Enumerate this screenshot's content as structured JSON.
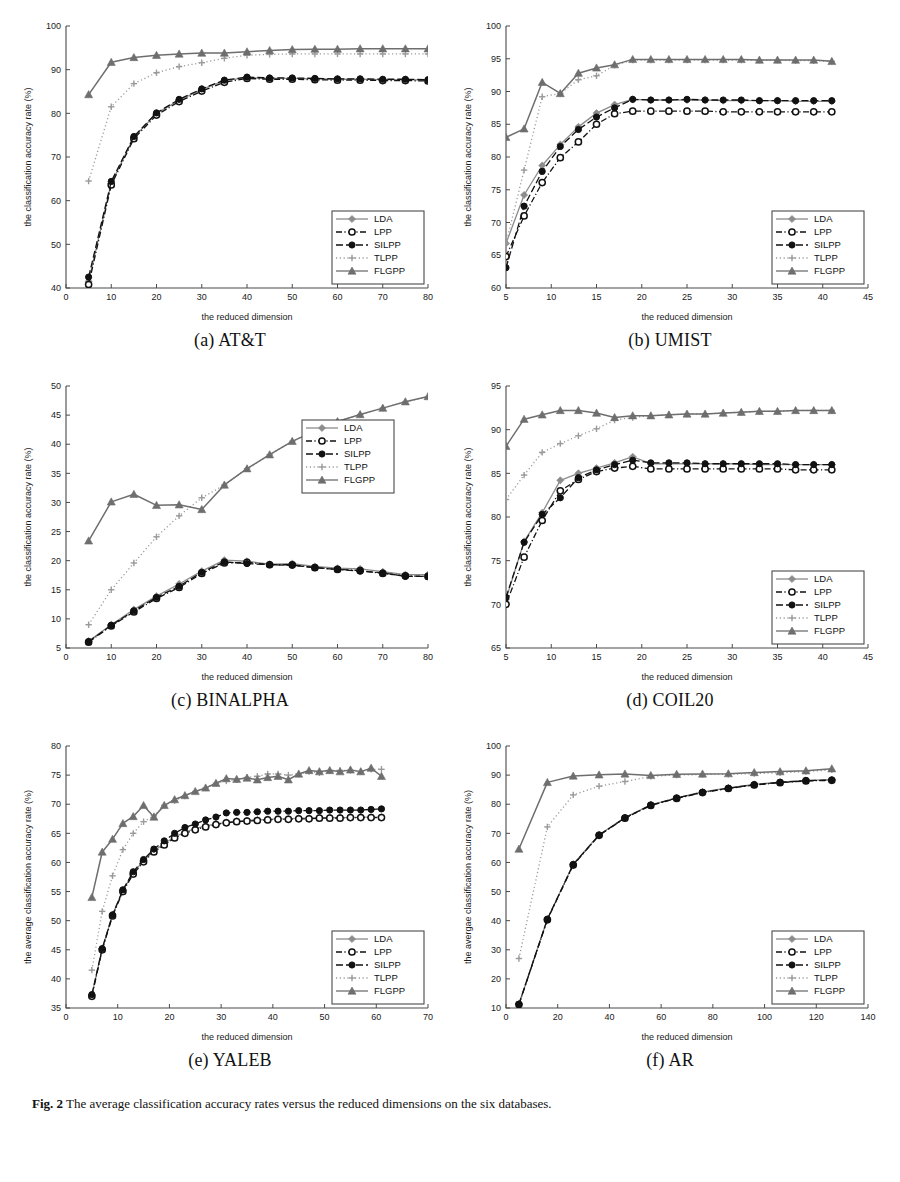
{
  "figure": {
    "caption_label": "Fig. 2",
    "caption_text": "The average classification accuracy rates versus the reduced dimensions on the six databases.",
    "series_names": [
      "LDA",
      "LPP",
      "SILPP",
      "TLPP",
      "FLGPP"
    ],
    "series_colors": {
      "LDA": "#8c8c8c",
      "LPP": "#111111",
      "SILPP": "#111111",
      "TLPP": "#9a9a9a",
      "FLGPP": "#6e6e6e"
    },
    "series_markers": {
      "LDA": "diamond",
      "LPP": "circle-open",
      "SILPP": "circle-filled",
      "TLPP": "plus",
      "FLGPP": "triangle"
    },
    "series_dash": {
      "LDA": "solid",
      "LPP": "dashdot",
      "SILPP": "dashed",
      "TLPP": "dotted",
      "FLGPP": "solid"
    }
  },
  "chart_data": [
    {
      "id": "att",
      "type": "line",
      "title": "(a) AT&T",
      "xlabel": "the reduced dimension",
      "ylabel": "the classification accuracy rate (%)",
      "xlim": [
        0,
        80
      ],
      "ylim": [
        40,
        100
      ],
      "xticks": [
        0,
        10,
        20,
        30,
        40,
        50,
        60,
        70,
        80
      ],
      "yticks": [
        40,
        50,
        60,
        70,
        80,
        90,
        100
      ],
      "grid": false,
      "legend_position": "lower-right",
      "x": [
        5,
        10,
        15,
        20,
        25,
        30,
        35,
        40,
        45,
        50,
        55,
        60,
        65,
        70,
        75,
        80
      ],
      "series": [
        {
          "name": "LDA",
          "values": [
            41.5,
            64.0,
            74.5,
            80.0,
            83.0,
            85.5,
            87.5,
            88.2,
            88.0,
            88.0,
            87.9,
            87.8,
            87.8,
            87.7,
            87.7,
            87.6
          ]
        },
        {
          "name": "LPP",
          "values": [
            40.8,
            63.6,
            74.2,
            79.6,
            82.7,
            85.1,
            87.1,
            88.0,
            87.8,
            87.8,
            87.7,
            87.6,
            87.6,
            87.5,
            87.5,
            87.4
          ]
        },
        {
          "name": "SILPP",
          "values": [
            42.5,
            64.4,
            74.7,
            80.1,
            83.2,
            85.6,
            87.6,
            88.3,
            88.1,
            88.1,
            88.0,
            87.9,
            87.9,
            87.8,
            87.8,
            87.7
          ]
        },
        {
          "name": "TLPP",
          "values": [
            64.5,
            81.5,
            86.8,
            89.3,
            90.7,
            91.6,
            92.6,
            93.3,
            93.5,
            93.6,
            93.6,
            93.6,
            93.6,
            93.6,
            93.6,
            93.6
          ]
        },
        {
          "name": "FLGPP",
          "values": [
            84.3,
            91.7,
            92.8,
            93.3,
            93.6,
            93.8,
            93.8,
            94.1,
            94.4,
            94.6,
            94.7,
            94.7,
            94.8,
            94.8,
            94.8,
            94.8
          ]
        }
      ]
    },
    {
      "id": "umist",
      "type": "line",
      "title": "(b) UMIST",
      "xlabel": "the reduced dimension",
      "ylabel": "the classification accuracy rate (%)",
      "xlim": [
        5,
        45
      ],
      "ylim": [
        60,
        100
      ],
      "xticks": [
        5,
        10,
        15,
        20,
        25,
        30,
        35,
        40,
        45
      ],
      "yticks": [
        60,
        65,
        70,
        75,
        80,
        85,
        90,
        95,
        100
      ],
      "grid": false,
      "legend_position": "lower-right",
      "x": [
        5,
        7,
        9,
        11,
        13,
        15,
        17,
        19,
        21,
        23,
        25,
        27,
        29,
        31,
        33,
        35,
        37,
        39,
        41
      ],
      "series": [
        {
          "name": "LDA",
          "values": [
            66.8,
            74.2,
            78.7,
            81.9,
            84.6,
            86.7,
            88.0,
            88.8,
            88.7,
            88.7,
            88.7,
            88.7,
            88.6,
            88.6,
            88.6,
            88.6,
            88.5,
            88.5,
            88.5
          ]
        },
        {
          "name": "LPP",
          "values": [
            64.8,
            71.0,
            76.1,
            79.9,
            82.3,
            85.0,
            86.6,
            87.0,
            87.0,
            87.0,
            87.0,
            87.0,
            86.9,
            86.9,
            86.9,
            86.9,
            86.9,
            86.9,
            86.9
          ]
        },
        {
          "name": "SILPP",
          "values": [
            63.1,
            72.5,
            77.8,
            81.6,
            84.2,
            86.1,
            87.5,
            88.8,
            88.7,
            88.7,
            88.8,
            88.7,
            88.7,
            88.7,
            88.6,
            88.6,
            88.6,
            88.6,
            88.6
          ]
        },
        {
          "name": "TLPP",
          "values": [
            66.8,
            78.0,
            89.2,
            89.7,
            91.8,
            92.4,
            94.0,
            94.8,
            94.8,
            94.8,
            94.8,
            94.8,
            94.8,
            94.8,
            94.8,
            94.8,
            94.7,
            94.7,
            94.6
          ]
        },
        {
          "name": "FLGPP",
          "values": [
            83.0,
            84.3,
            91.4,
            89.7,
            92.8,
            93.6,
            94.1,
            94.9,
            94.9,
            94.9,
            94.9,
            94.9,
            94.9,
            94.9,
            94.8,
            94.8,
            94.8,
            94.8,
            94.6
          ]
        }
      ]
    },
    {
      "id": "binalpha",
      "type": "line",
      "title": "(c) BINALPHA",
      "xlabel": "the reduced dimension",
      "ylabel": "the classification accuracy rate (%)",
      "xlim": [
        0,
        80
      ],
      "ylim": [
        5,
        50
      ],
      "xticks": [
        0,
        10,
        20,
        30,
        40,
        50,
        60,
        70,
        80
      ],
      "yticks": [
        5,
        10,
        15,
        20,
        25,
        30,
        35,
        40,
        45,
        50
      ],
      "grid": false,
      "legend_position": "upper-right",
      "x": [
        5,
        10,
        15,
        20,
        25,
        30,
        35,
        40,
        45,
        50,
        55,
        60,
        65,
        70,
        75,
        80
      ],
      "series": [
        {
          "name": "LDA",
          "values": [
            6.2,
            9.0,
            11.6,
            13.9,
            16.0,
            18.2,
            20.1,
            19.9,
            19.4,
            19.5,
            19.0,
            18.7,
            18.6,
            18.1,
            17.6,
            17.6
          ]
        },
        {
          "name": "LPP",
          "values": [
            6.0,
            8.8,
            11.2,
            13.5,
            15.4,
            17.8,
            19.6,
            19.7,
            19.3,
            19.3,
            18.8,
            18.5,
            18.3,
            17.8,
            17.4,
            17.3
          ]
        },
        {
          "name": "SILPP",
          "values": [
            6.1,
            8.9,
            11.4,
            13.7,
            15.6,
            18.0,
            19.8,
            19.5,
            19.3,
            19.2,
            18.8,
            18.5,
            18.2,
            17.9,
            17.3,
            17.3
          ]
        },
        {
          "name": "TLPP",
          "values": [
            9.0,
            15.0,
            19.6,
            24.1,
            27.7,
            30.8,
            33.0,
            35.8,
            38.2,
            40.5,
            42.3,
            43.9,
            45.1,
            46.2,
            47.3,
            48.1
          ]
        },
        {
          "name": "FLGPP",
          "values": [
            23.4,
            30.1,
            31.4,
            29.5,
            29.6,
            28.8,
            33.0,
            35.8,
            38.2,
            40.5,
            42.3,
            43.9,
            45.1,
            46.2,
            47.3,
            48.2
          ]
        }
      ]
    },
    {
      "id": "coil20",
      "type": "line",
      "title": "(d) COIL20",
      "xlabel": "the reduced dimension",
      "ylabel": "the classification accuracy rate (%)",
      "xlim": [
        5,
        45
      ],
      "ylim": [
        65,
        95
      ],
      "xticks": [
        5,
        10,
        15,
        20,
        25,
        30,
        35,
        40,
        45
      ],
      "yticks": [
        65,
        70,
        75,
        80,
        85,
        90,
        95
      ],
      "grid": false,
      "legend_position": "lower-right",
      "x": [
        5,
        7,
        9,
        11,
        13,
        15,
        17,
        19,
        21,
        23,
        25,
        27,
        29,
        31,
        33,
        35,
        37,
        39,
        41
      ],
      "series": [
        {
          "name": "LDA",
          "values": [
            70.6,
            77.2,
            80.5,
            84.2,
            85.0,
            85.6,
            86.2,
            86.9,
            86.1,
            86.1,
            86.1,
            86.1,
            86.1,
            86.1,
            86.0,
            86.0,
            86.0,
            86.0,
            86.0
          ]
        },
        {
          "name": "LPP",
          "values": [
            70.0,
            75.4,
            79.6,
            83.0,
            84.3,
            85.2,
            85.6,
            85.8,
            85.5,
            85.5,
            85.5,
            85.5,
            85.5,
            85.5,
            85.5,
            85.5,
            85.4,
            85.4,
            85.4
          ]
        },
        {
          "name": "SILPP",
          "values": [
            70.8,
            77.1,
            80.3,
            82.2,
            84.5,
            85.4,
            86.0,
            86.5,
            86.2,
            86.2,
            86.2,
            86.1,
            86.1,
            86.1,
            86.1,
            86.1,
            86.0,
            86.0,
            86.0
          ]
        },
        {
          "name": "TLPP",
          "values": [
            82.0,
            84.8,
            87.4,
            88.4,
            89.3,
            90.1,
            91.1,
            91.4,
            91.6,
            91.7,
            91.8,
            91.8,
            91.9,
            92.0,
            92.1,
            92.1,
            92.2,
            92.2,
            92.2
          ]
        },
        {
          "name": "FLGPP",
          "values": [
            88.1,
            91.2,
            91.7,
            92.2,
            92.2,
            91.9,
            91.4,
            91.6,
            91.6,
            91.7,
            91.8,
            91.8,
            91.9,
            92.0,
            92.1,
            92.1,
            92.2,
            92.2,
            92.2
          ]
        }
      ]
    },
    {
      "id": "yaleb",
      "type": "line",
      "title": "(e) YALEB",
      "xlabel": "the reduced dimension",
      "ylabel": "the average classification accuracy rate (%)",
      "xlim": [
        0,
        70
      ],
      "ylim": [
        35,
        80
      ],
      "xticks": [
        0,
        10,
        20,
        30,
        40,
        50,
        60,
        70
      ],
      "yticks": [
        35,
        40,
        45,
        50,
        55,
        60,
        65,
        70,
        75,
        80
      ],
      "grid": false,
      "legend_position": "lower-right",
      "x": [
        5,
        7,
        9,
        11,
        13,
        15,
        17,
        19,
        21,
        23,
        25,
        27,
        29,
        31,
        33,
        35,
        37,
        39,
        41,
        43,
        45,
        47,
        49,
        51,
        53,
        55,
        57,
        59,
        61
      ],
      "series": [
        {
          "name": "LDA",
          "values": [
            37.2,
            45.2,
            51.0,
            55.2,
            58.2,
            60.3,
            62.0,
            63.2,
            64.4,
            65.2,
            65.8,
            66.3,
            66.6,
            66.9,
            67.1,
            67.2,
            67.3,
            67.4,
            67.5,
            67.5,
            67.6,
            67.6,
            67.7,
            67.7,
            67.7,
            67.7,
            67.8,
            67.8,
            67.8
          ]
        },
        {
          "name": "LPP",
          "values": [
            37.0,
            45.0,
            50.8,
            55.0,
            58.0,
            60.1,
            61.8,
            63.0,
            64.2,
            65.0,
            65.6,
            66.1,
            66.5,
            66.8,
            67.0,
            67.1,
            67.2,
            67.3,
            67.4,
            67.4,
            67.5,
            67.5,
            67.6,
            67.6,
            67.6,
            67.7,
            67.7,
            67.7,
            67.7
          ]
        },
        {
          "name": "SILPP",
          "values": [
            37.3,
            45.2,
            51.0,
            55.3,
            58.4,
            60.5,
            62.3,
            63.7,
            65.0,
            66.0,
            66.6,
            67.3,
            67.8,
            68.5,
            68.6,
            68.6,
            68.7,
            68.8,
            68.8,
            68.8,
            68.9,
            68.9,
            68.9,
            69.0,
            69.0,
            69.0,
            69.0,
            69.1,
            69.2
          ]
        },
        {
          "name": "TLPP",
          "values": [
            41.5,
            51.6,
            57.7,
            62.2,
            65.0,
            67.0,
            68.0,
            69.8,
            70.6,
            71.4,
            72.2,
            72.8,
            73.6,
            74.0,
            74.2,
            74.6,
            74.8,
            75.2,
            75.2,
            75.0,
            75.2,
            75.6,
            75.4,
            75.8,
            75.8,
            75.8,
            75.6,
            76.0,
            76.0
          ]
        },
        {
          "name": "FLGPP",
          "values": [
            54.0,
            61.8,
            64.0,
            66.7,
            67.9,
            69.8,
            67.8,
            69.8,
            70.8,
            71.5,
            72.2,
            72.8,
            73.6,
            74.4,
            74.3,
            74.5,
            74.2,
            74.6,
            74.8,
            74.2,
            75.2,
            75.8,
            75.6,
            75.8,
            75.6,
            75.9,
            75.6,
            76.2,
            74.8
          ]
        }
      ]
    },
    {
      "id": "ar",
      "type": "line",
      "title": "(f) AR",
      "xlabel": "the reduced dimension",
      "ylabel": "the avergae classification accuracy rate (%)",
      "xlim": [
        0,
        140
      ],
      "ylim": [
        10,
        100
      ],
      "xticks": [
        0,
        20,
        40,
        60,
        80,
        100,
        120,
        140
      ],
      "yticks": [
        10,
        20,
        30,
        40,
        50,
        60,
        70,
        80,
        90,
        100
      ],
      "grid": false,
      "legend_position": "lower-right",
      "x": [
        5,
        16,
        26,
        36,
        46,
        56,
        66,
        76,
        86,
        96,
        106,
        116,
        126
      ],
      "series": [
        {
          "name": "LDA",
          "values": [
            11.4,
            40.6,
            59.4,
            69.5,
            75.4,
            79.8,
            82.2,
            84.2,
            85.6,
            86.8,
            87.6,
            88.2,
            88.4
          ]
        },
        {
          "name": "LPP",
          "values": [
            11.2,
            40.3,
            59.1,
            69.3,
            75.2,
            79.6,
            82.0,
            84.0,
            85.4,
            86.6,
            87.4,
            88.0,
            88.2
          ]
        },
        {
          "name": "SILPP",
          "values": [
            11.3,
            40.5,
            59.3,
            69.4,
            75.3,
            79.7,
            82.1,
            84.1,
            85.5,
            86.7,
            87.5,
            88.1,
            88.3
          ]
        },
        {
          "name": "TLPP",
          "values": [
            27.0,
            72.2,
            83.2,
            86.2,
            87.8,
            89.6,
            90.0,
            90.2,
            90.3,
            90.5,
            90.8,
            91.2,
            91.8
          ]
        },
        {
          "name": "FLGPP",
          "values": [
            64.6,
            87.5,
            89.7,
            90.1,
            90.4,
            89.9,
            90.3,
            90.4,
            90.5,
            90.9,
            91.2,
            91.5,
            92.2
          ]
        }
      ]
    }
  ]
}
